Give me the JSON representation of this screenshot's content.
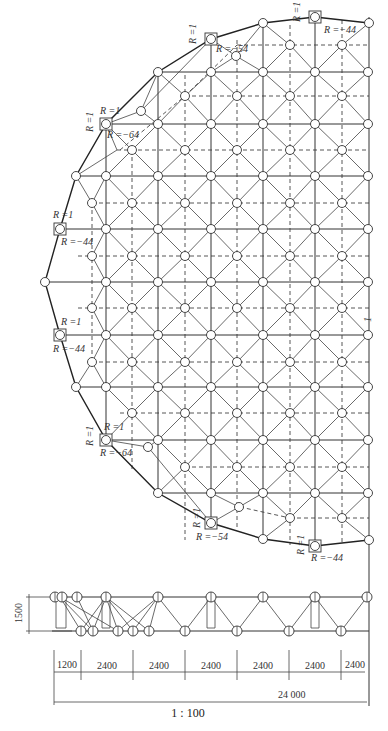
{
  "plan": {
    "support_labels": {
      "top_right": {
        "r1": "R =1",
        "rz": "R =−44"
      },
      "top_mid": {
        "r1": "R =1",
        "rz": "R =−54"
      },
      "upper_left": {
        "r1": "R =1",
        "rx": "R =1",
        "rz": "R =−64"
      },
      "left_upper": {
        "rx": "R =1",
        "rz": "R =−44"
      },
      "left_lower": {
        "rx": "R =1",
        "rz": "R =−44"
      },
      "lower_left": {
        "r1": "R =1",
        "rx": "R =1",
        "rz": "R =−64"
      },
      "bottom_mid": {
        "r1": "R =1",
        "rz": "R =−54"
      },
      "bottom_right": {
        "r1": "R =1",
        "rz": "R =−44"
      }
    },
    "centerline_mark": "1"
  },
  "elevation": {
    "height_label": "1500",
    "spans": [
      "1200",
      "2400",
      "2400",
      "2400",
      "2400",
      "2400",
      "2400"
    ],
    "total": "24 000"
  },
  "scale": "1 : 100",
  "colors": {
    "line": "#333333",
    "background": "#ffffff"
  }
}
